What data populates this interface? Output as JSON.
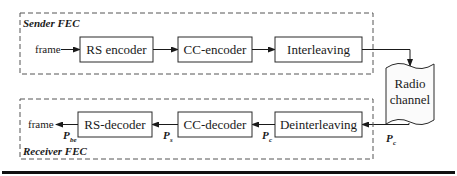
{
  "diagram": {
    "sender": {
      "title": "Sender FEC",
      "input_label": "frame",
      "blocks": [
        "RS encoder",
        "CC-encoder",
        "Interleaving"
      ]
    },
    "channel": {
      "line1": "Radio",
      "line2": "channel"
    },
    "receiver": {
      "title": "Receiver FEC",
      "output_label": "frame",
      "blocks": [
        "RS-decoder",
        "CC-decoder",
        "Deinterleaving"
      ]
    },
    "probabilities": {
      "channel_out": {
        "symbol": "P",
        "sub": "c"
      },
      "deint_out": {
        "symbol": "P",
        "sub": "c"
      },
      "cc_dec_out": {
        "symbol": "P",
        "sub": "s"
      },
      "rs_dec_out": {
        "symbol": "P",
        "sub": "be"
      }
    },
    "colors": {
      "stroke": "#2a2a2a",
      "dashed": "#555555",
      "bottom_rule": "#111111"
    }
  }
}
